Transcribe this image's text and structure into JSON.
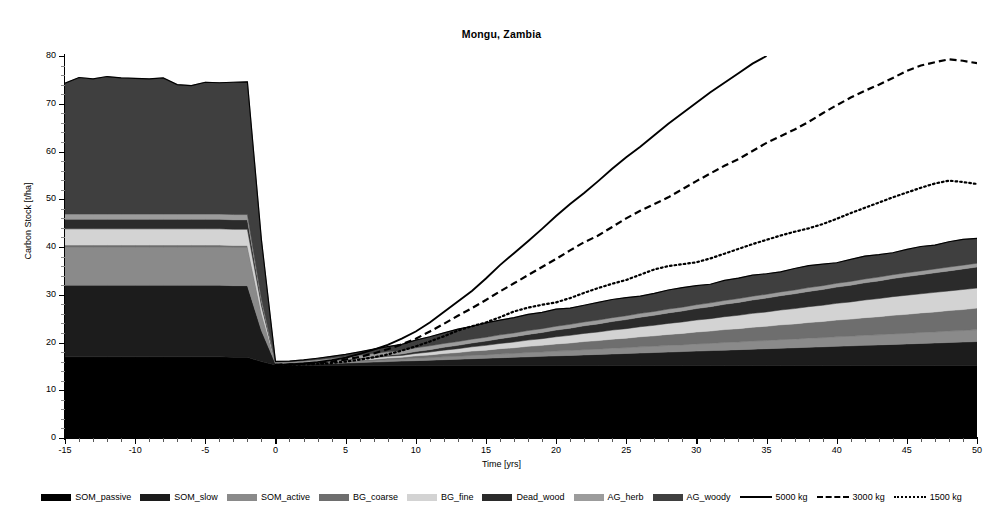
{
  "chart_data": {
    "type": "area",
    "title": "Mongu, Zambia",
    "xlabel": "Time [yrs]",
    "ylabel": "Carbon Stock [t/ha]",
    "xlim": [
      -15,
      50
    ],
    "ylim": [
      0,
      80
    ],
    "xticks": [
      -15,
      -10,
      -5,
      0,
      5,
      10,
      15,
      20,
      25,
      30,
      35,
      40,
      45,
      50
    ],
    "yticks": [
      0,
      10,
      20,
      30,
      40,
      50,
      60,
      70,
      80
    ],
    "grid": false,
    "legend_position": "bottom",
    "x": [
      -15,
      -14,
      -13,
      -12,
      -11,
      -10,
      -9,
      -8,
      -7,
      -6,
      -5,
      -4,
      -3,
      -2,
      -1,
      0,
      1,
      2,
      3,
      4,
      5,
      6,
      7,
      8,
      9,
      10,
      11,
      12,
      13,
      14,
      15,
      16,
      17,
      18,
      19,
      20,
      21,
      22,
      23,
      24,
      25,
      26,
      27,
      28,
      29,
      30,
      31,
      32,
      33,
      34,
      35,
      36,
      37,
      38,
      39,
      40,
      41,
      42,
      43,
      44,
      45,
      46,
      47,
      48,
      49,
      50
    ],
    "stack_order": [
      "SOM_passive",
      "SOM_slow",
      "SOM_active",
      "BG_coarse",
      "BG_fine",
      "Dead_wood",
      "AG_herb",
      "AG_woody"
    ],
    "series": [
      {
        "name": "SOM_passive",
        "color": "#000000",
        "values": [
          17.0,
          17.0,
          17.0,
          17.0,
          17.0,
          17.0,
          17.0,
          17.0,
          17.0,
          17.0,
          17.0,
          17.0,
          16.9,
          16.9,
          16.0,
          15.3,
          15.2,
          15.2,
          15.2,
          15.2,
          15.2,
          15.2,
          15.2,
          15.2,
          15.2,
          15.2,
          15.2,
          15.2,
          15.2,
          15.2,
          15.2,
          15.2,
          15.2,
          15.2,
          15.2,
          15.2,
          15.2,
          15.2,
          15.2,
          15.2,
          15.2,
          15.2,
          15.2,
          15.2,
          15.2,
          15.2,
          15.2,
          15.2,
          15.2,
          15.2,
          15.2,
          15.2,
          15.2,
          15.2,
          15.2,
          15.2,
          15.2,
          15.2,
          15.2,
          15.2,
          15.2,
          15.2,
          15.2,
          15.2,
          15.2,
          15.2
        ]
      },
      {
        "name": "SOM_slow",
        "color": "#1c1c1c",
        "values": [
          15.0,
          15.0,
          15.0,
          15.0,
          15.0,
          15.0,
          15.0,
          15.0,
          15.0,
          15.0,
          15.0,
          15.0,
          15.0,
          15.0,
          6.5,
          0.3,
          0.3,
          0.3,
          0.4,
          0.4,
          0.5,
          0.6,
          0.7,
          0.8,
          0.9,
          1.0,
          1.1,
          1.2,
          1.3,
          1.4,
          1.5,
          1.6,
          1.7,
          1.8,
          1.9,
          2.0,
          2.1,
          2.2,
          2.3,
          2.4,
          2.5,
          2.6,
          2.7,
          2.8,
          2.9,
          3.0,
          3.1,
          3.2,
          3.3,
          3.4,
          3.5,
          3.6,
          3.7,
          3.8,
          3.9,
          4.0,
          4.1,
          4.2,
          4.3,
          4.4,
          4.5,
          4.6,
          4.7,
          4.8,
          4.9,
          5.0
        ]
      },
      {
        "name": "SOM_active",
        "color": "#8a8a8a",
        "values": [
          8.0,
          8.0,
          8.0,
          8.0,
          8.0,
          8.0,
          8.0,
          8.0,
          8.0,
          8.0,
          8.0,
          8.0,
          8.0,
          8.0,
          3.5,
          0.1,
          0.1,
          0.1,
          0.1,
          0.2,
          0.2,
          0.3,
          0.3,
          0.4,
          0.4,
          0.5,
          0.5,
          0.6,
          0.6,
          0.7,
          0.7,
          0.8,
          0.8,
          0.9,
          0.9,
          1.0,
          1.0,
          1.1,
          1.1,
          1.2,
          1.2,
          1.3,
          1.3,
          1.4,
          1.4,
          1.5,
          1.5,
          1.6,
          1.6,
          1.7,
          1.7,
          1.8,
          1.8,
          1.9,
          1.9,
          2.0,
          2.0,
          2.1,
          2.1,
          2.2,
          2.2,
          2.3,
          2.3,
          2.4,
          2.4,
          2.5
        ]
      },
      {
        "name": "BG_coarse",
        "color": "#6e6e6e",
        "values": [
          0.4,
          0.4,
          0.4,
          0.4,
          0.4,
          0.4,
          0.4,
          0.4,
          0.4,
          0.4,
          0.4,
          0.4,
          0.4,
          0.4,
          0.2,
          0.05,
          0.05,
          0.1,
          0.1,
          0.15,
          0.2,
          0.25,
          0.3,
          0.35,
          0.4,
          0.5,
          0.6,
          0.7,
          0.8,
          0.9,
          1.0,
          1.1,
          1.2,
          1.3,
          1.4,
          1.5,
          1.6,
          1.7,
          1.8,
          1.9,
          2.0,
          2.1,
          2.2,
          2.3,
          2.4,
          2.5,
          2.6,
          2.7,
          2.8,
          2.9,
          3.0,
          3.1,
          3.2,
          3.3,
          3.4,
          3.5,
          3.6,
          3.7,
          3.8,
          3.9,
          4.0,
          4.1,
          4.2,
          4.3,
          4.4,
          4.5
        ]
      },
      {
        "name": "BG_fine",
        "color": "#d3d3d3",
        "values": [
          3.4,
          3.4,
          3.4,
          3.4,
          3.4,
          3.4,
          3.4,
          3.4,
          3.4,
          3.4,
          3.4,
          3.4,
          3.4,
          3.4,
          1.5,
          0.05,
          0.05,
          0.1,
          0.1,
          0.15,
          0.2,
          0.25,
          0.3,
          0.35,
          0.4,
          0.5,
          0.6,
          0.7,
          0.8,
          0.9,
          1.0,
          1.1,
          1.2,
          1.3,
          1.4,
          1.5,
          1.6,
          1.7,
          1.8,
          1.9,
          2.0,
          2.1,
          2.2,
          2.3,
          2.4,
          2.5,
          2.6,
          2.7,
          2.8,
          2.9,
          3.0,
          3.1,
          3.2,
          3.3,
          3.4,
          3.5,
          3.6,
          3.7,
          3.8,
          3.9,
          4.0,
          4.0,
          4.1,
          4.1,
          4.2,
          4.2
        ]
      },
      {
        "name": "Dead_wood",
        "color": "#2b2b2b",
        "values": [
          2.0,
          2.0,
          2.0,
          2.0,
          2.0,
          2.0,
          2.0,
          2.0,
          2.0,
          2.0,
          2.0,
          2.0,
          2.0,
          2.0,
          0.9,
          0.05,
          0.05,
          0.05,
          0.1,
          0.1,
          0.1,
          0.15,
          0.2,
          0.25,
          0.3,
          0.4,
          0.5,
          0.6,
          0.7,
          0.8,
          0.9,
          1.0,
          1.1,
          1.2,
          1.3,
          1.4,
          1.5,
          1.6,
          1.7,
          1.8,
          1.9,
          2.0,
          2.1,
          2.2,
          2.3,
          2.4,
          2.5,
          2.6,
          2.7,
          2.8,
          2.9,
          3.0,
          3.1,
          3.2,
          3.3,
          3.4,
          3.5,
          3.6,
          3.7,
          3.8,
          3.9,
          4.0,
          4.1,
          4.2,
          4.3,
          4.4
        ]
      },
      {
        "name": "AG_herb",
        "color": "#9c9c9c",
        "values": [
          1.1,
          1.1,
          1.1,
          1.1,
          1.1,
          1.1,
          1.1,
          1.1,
          1.1,
          1.1,
          1.1,
          1.1,
          1.1,
          1.1,
          0.5,
          0.1,
          0.2,
          0.3,
          0.4,
          0.5,
          0.6,
          0.6,
          0.7,
          0.7,
          0.7,
          0.8,
          0.8,
          0.8,
          0.8,
          0.8,
          0.8,
          0.8,
          0.8,
          0.8,
          0.8,
          0.8,
          0.8,
          0.8,
          0.8,
          0.8,
          0.8,
          0.8,
          0.8,
          0.8,
          0.8,
          0.8,
          0.8,
          0.8,
          0.8,
          0.8,
          0.8,
          0.8,
          0.8,
          0.8,
          0.8,
          0.8,
          0.8,
          0.8,
          0.8,
          0.8,
          0.8,
          0.8,
          0.8,
          0.8,
          0.8,
          0.8
        ]
      },
      {
        "name": "AG_woody",
        "color": "#3f3f3f",
        "values": [
          27.4,
          28.6,
          28.3,
          28.8,
          28.5,
          28.4,
          28.3,
          28.5,
          27.1,
          26.9,
          27.6,
          27.5,
          27.7,
          27.8,
          12.4,
          0.1,
          0.15,
          0.2,
          0.3,
          0.4,
          0.5,
          0.7,
          0.9,
          1.1,
          1.3,
          1.6,
          1.9,
          2.2,
          2.6,
          2.7,
          3.0,
          3.1,
          3.2,
          3.4,
          3.4,
          3.6,
          3.4,
          3.5,
          3.7,
          3.8,
          3.8,
          3.6,
          3.8,
          4.0,
          4.1,
          4.0,
          3.9,
          4.2,
          4.3,
          4.4,
          4.3,
          4.2,
          4.5,
          4.6,
          4.5,
          4.3,
          4.6,
          4.8,
          4.7,
          4.6,
          4.9,
          5.1,
          5.0,
          5.3,
          5.4,
          5.2
        ]
      }
    ],
    "lines": [
      {
        "name": "5000 kg",
        "style": "solid",
        "color": "#000000",
        "x": [
          0,
          1,
          2,
          3,
          4,
          5,
          6,
          7,
          8,
          9,
          10,
          11,
          12,
          13,
          14,
          15,
          16,
          17,
          18,
          19,
          20,
          21,
          22,
          23,
          24,
          25,
          26,
          27,
          28,
          29,
          30,
          31,
          32,
          33,
          34,
          35
        ],
        "values": [
          15.3,
          15.4,
          15.6,
          15.9,
          16.3,
          16.8,
          17.6,
          18.5,
          19.5,
          20.8,
          22.3,
          24.2,
          26.4,
          28.6,
          30.8,
          33.4,
          36.2,
          38.7,
          41.2,
          43.8,
          46.5,
          49.0,
          51.3,
          53.8,
          56.4,
          58.8,
          61.0,
          63.4,
          65.8,
          68.0,
          70.2,
          72.4,
          74.4,
          76.4,
          78.4,
          80.0
        ]
      },
      {
        "name": "3000 kg",
        "style": "dashed",
        "color": "#000000",
        "x": [
          0,
          1,
          2,
          3,
          4,
          5,
          6,
          7,
          8,
          9,
          10,
          11,
          12,
          13,
          14,
          15,
          16,
          17,
          18,
          19,
          20,
          21,
          22,
          23,
          24,
          25,
          26,
          27,
          28,
          29,
          30,
          31,
          32,
          33,
          34,
          35,
          36,
          37,
          38,
          39,
          40,
          41,
          42,
          43,
          44,
          45,
          46,
          47,
          48,
          49,
          50
        ],
        "values": [
          15.3,
          15.4,
          15.5,
          15.7,
          16.0,
          16.4,
          17.0,
          17.7,
          18.6,
          19.6,
          20.8,
          22.3,
          23.9,
          25.6,
          27.2,
          28.9,
          30.7,
          32.4,
          34.1,
          35.8,
          37.5,
          39.3,
          41.0,
          42.4,
          44.2,
          46.0,
          47.6,
          49.0,
          50.4,
          52.1,
          53.8,
          55.4,
          57.0,
          58.4,
          60.1,
          61.8,
          63.2,
          64.6,
          66.2,
          68.0,
          69.7,
          71.3,
          72.7,
          74.0,
          75.4,
          76.9,
          78.0,
          78.7,
          79.3,
          79.0,
          78.5
        ]
      },
      {
        "name": "1500 kg",
        "style": "dotted",
        "color": "#000000",
        "x": [
          0,
          1,
          2,
          3,
          4,
          5,
          6,
          7,
          8,
          9,
          10,
          11,
          12,
          13,
          14,
          15,
          16,
          17,
          18,
          19,
          20,
          21,
          22,
          23,
          24,
          25,
          26,
          27,
          28,
          29,
          30,
          31,
          32,
          33,
          34,
          35,
          36,
          37,
          38,
          39,
          40,
          41,
          42,
          43,
          44,
          45,
          46,
          47,
          48,
          49,
          50
        ],
        "values": [
          15.3,
          15.3,
          15.4,
          15.5,
          15.7,
          16.0,
          16.4,
          16.9,
          17.5,
          18.3,
          19.2,
          20.2,
          21.3,
          22.5,
          23.4,
          24.2,
          25.3,
          26.5,
          27.3,
          27.9,
          28.4,
          29.3,
          30.4,
          31.4,
          32.3,
          33.1,
          34.2,
          35.3,
          36.0,
          36.4,
          36.8,
          37.6,
          38.6,
          39.6,
          40.6,
          41.5,
          42.4,
          43.2,
          43.9,
          44.8,
          45.9,
          47.1,
          48.2,
          49.3,
          50.4,
          51.4,
          52.4,
          53.3,
          53.9,
          53.6,
          53.2
        ]
      }
    ]
  },
  "legend": {
    "items": [
      {
        "label": "SOM_passive",
        "kind": "swatch",
        "color": "#000000"
      },
      {
        "label": "SOM_slow",
        "kind": "swatch",
        "color": "#1c1c1c"
      },
      {
        "label": "SOM_active",
        "kind": "swatch",
        "color": "#8a8a8a"
      },
      {
        "label": "BG_coarse",
        "kind": "swatch",
        "color": "#6e6e6e"
      },
      {
        "label": "BG_fine",
        "kind": "swatch",
        "color": "#d3d3d3"
      },
      {
        "label": "Dead_wood",
        "kind": "swatch",
        "color": "#2b2b2b"
      },
      {
        "label": "AG_herb",
        "kind": "swatch",
        "color": "#9c9c9c"
      },
      {
        "label": "AG_woody",
        "kind": "swatch",
        "color": "#3f3f3f"
      },
      {
        "label": "5000 kg",
        "kind": "line",
        "style": "solid",
        "color": "#000000"
      },
      {
        "label": "3000 kg",
        "kind": "line",
        "style": "dashed",
        "color": "#000000"
      },
      {
        "label": "1500 kg",
        "kind": "line",
        "style": "dotted",
        "color": "#000000"
      }
    ]
  }
}
